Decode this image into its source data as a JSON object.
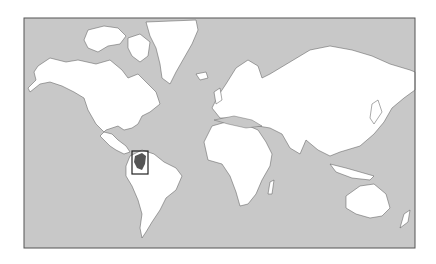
{
  "map": {
    "type": "world-locator-map",
    "projection": "mercator",
    "highlighted_country": "Colombia",
    "colors": {
      "background": "#ffffff",
      "ocean": "#c8c8c8",
      "land": "#ffffff",
      "border": "#555555",
      "highlight": "#555555",
      "frame": "#555555",
      "locator_box": "#222222"
    },
    "frame": {
      "x": 24,
      "y": 18,
      "width": 391,
      "height": 230
    },
    "locator_box": {
      "x": 132,
      "y": 151,
      "width": 16,
      "height": 23
    }
  }
}
